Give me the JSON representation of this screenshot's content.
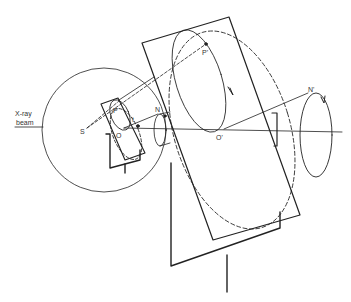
{
  "figure": {
    "labels": {
      "xray_beam_line1": "X-ray",
      "xray_beam_line2": "beam",
      "S": "S",
      "O": "O",
      "P": "P",
      "t": "t",
      "N": "N",
      "P_prime": "P'",
      "O_prime": "O'",
      "N_prime": "N'"
    },
    "colors": {
      "stroke": "#222222",
      "background": "#ffffff"
    }
  }
}
